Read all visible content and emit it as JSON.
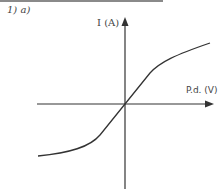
{
  "question_label": "1) a)",
  "diagram": {
    "y_axis_label": "I (A)",
    "x_axis_label": "P.d. (V)",
    "curve_description": "I-V characteristic: steep linear through origin, curving to flatter slopes at both ends (filament-lamp style)",
    "colors": {
      "axis": "#333333",
      "curve": "#333333",
      "text": "#444444"
    }
  }
}
